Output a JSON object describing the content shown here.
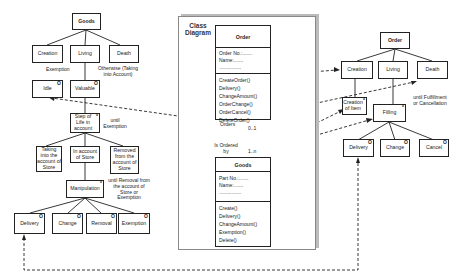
{
  "left_tree": {
    "root": "Goods",
    "level1": [
      "Creation",
      "Living",
      "Death"
    ],
    "idle": "Idle",
    "valuable": "Valuable",
    "exemption_label": "Exemption",
    "otherwise_label": "Otherwise (Taking into Account)",
    "step_of_life": "Step of Life in account",
    "until_exemption": "until Exemption",
    "level3": [
      "Taking into the account of Store",
      "In account of Store",
      "Removed from the account of Store"
    ],
    "manipulation": "Manipulation",
    "until_removal": "until Removal from the account of Store or Exemption",
    "actions": [
      "Delivery",
      "Change",
      "Removal",
      "Exemption"
    ],
    "marker_o": "O",
    "marker_star": "*"
  },
  "class_diagram": {
    "title": "Class Diagram",
    "order_class": {
      "name": "Order",
      "attributes": [
        "Order No.:.......",
        "Name:.......",
        "................"
      ],
      "operations": [
        "CreateOrder()",
        "Delivery()",
        "ChangeAmount()",
        "OrderChange()",
        "OrderCancel()",
        "DeleteOrder()"
      ]
    },
    "association": {
      "role_top": "Orders",
      "mult_top": "0..1",
      "role_bottom": "Is Ordered by",
      "mult_bottom": "1..n"
    },
    "goods_class": {
      "name": "Goods",
      "attributes": [
        "Part No.:.......",
        "Name:.......",
        "................"
      ],
      "operations": [
        "Create()",
        "Delivery()",
        "ChangeAmount()",
        "Exemption()",
        "Delete()"
      ]
    }
  },
  "right_tree": {
    "root": "Order",
    "level1": [
      "Creation",
      "Living",
      "Death"
    ],
    "creation_of_item": "Creation of Item",
    "filling": "Filling",
    "until_label": "until Fulfillment or Cancellation",
    "actions": [
      "Delivery",
      "Change",
      "Cancel"
    ],
    "marker_o": "O",
    "marker_star": "*"
  }
}
